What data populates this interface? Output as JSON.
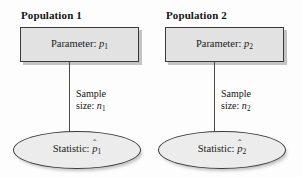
{
  "diagram": {
    "background_color": "#fdfdfd",
    "box_fill_color": "#e2e2e2",
    "ellipse_fill_color": "#ececec",
    "outline_color": "#3a3a3a",
    "connector_color": "#4a4a4a"
  },
  "groups": [
    {
      "id": "population-1",
      "title": "Population 1",
      "parameter": {
        "label": "Parameter:",
        "symbol": "p",
        "subscript": "1",
        "full_text": "Parameter: p1"
      },
      "sample_size": {
        "line1": "Sample",
        "line2_label": "size:",
        "symbol": "n",
        "subscript": "1",
        "full_text": "Sample size: n1"
      },
      "statistic": {
        "label": "Statistic:",
        "symbol": "p",
        "accent": "ˆ",
        "subscript": "1",
        "full_text": "Statistic: p̂1"
      }
    },
    {
      "id": "population-2",
      "title": "Population 2",
      "parameter": {
        "label": "Parameter:",
        "symbol": "p",
        "subscript": "2",
        "full_text": "Parameter: p2"
      },
      "sample_size": {
        "line1": "Sample",
        "line2_label": "size:",
        "symbol": "n",
        "subscript": "2",
        "full_text": "Sample size: n2"
      },
      "statistic": {
        "label": "Statistic:",
        "symbol": "p",
        "accent": "ˆ",
        "subscript": "2",
        "full_text": "Statistic: p̂2"
      }
    }
  ]
}
